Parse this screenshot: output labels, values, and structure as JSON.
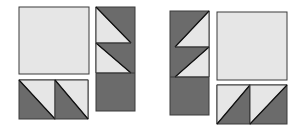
{
  "colors": {
    "light": "#e6e6e6",
    "dark": "#6b6b6b",
    "outline": "#3a3a3a",
    "background": "#ffffff"
  },
  "groups": [
    {
      "name": "left-group",
      "pieces": [
        {
          "type": "square",
          "label": "large-light-square"
        },
        {
          "type": "half-square-triangle",
          "label": "hst-bottom-1"
        },
        {
          "type": "half-square-triangle",
          "label": "hst-bottom-2"
        },
        {
          "type": "flying-geese-column",
          "label": "column-right"
        }
      ]
    },
    {
      "name": "right-group",
      "pieces": [
        {
          "type": "flying-geese-column",
          "label": "column-left"
        },
        {
          "type": "square",
          "label": "large-light-square"
        },
        {
          "type": "half-square-triangle",
          "label": "hst-bottom-1"
        },
        {
          "type": "half-square-triangle",
          "label": "hst-bottom-2"
        }
      ]
    }
  ]
}
